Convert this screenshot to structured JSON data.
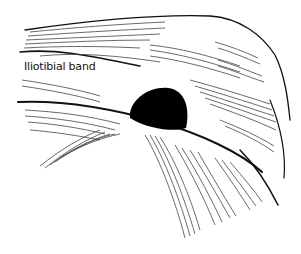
{
  "figure": {
    "type": "anatomical line illustration",
    "labels": [
      {
        "text": "Iliotibial band",
        "x": 22,
        "y": 60
      }
    ],
    "colors": {
      "ink": "#111111",
      "background": "#ffffff",
      "hatch": "#555555"
    }
  }
}
